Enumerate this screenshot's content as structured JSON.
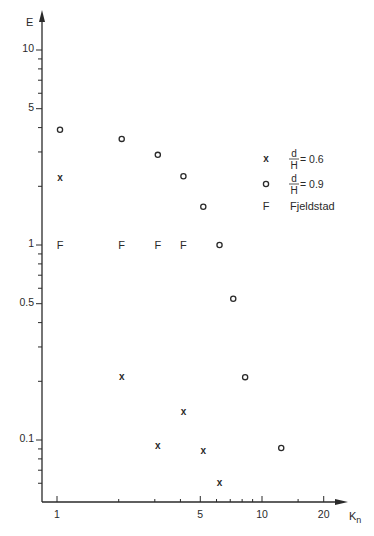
{
  "chart_data": {
    "type": "scatter",
    "title": "",
    "xlabel": "K_n",
    "ylabel": "E",
    "xscale": "log",
    "yscale": "log",
    "xlim": [
      0.85,
      30
    ],
    "ylim": [
      0.05,
      16
    ],
    "x_ticks_labeled": [
      1,
      5,
      10,
      20
    ],
    "x_tick_labels": [
      "1",
      "5",
      "10",
      "20"
    ],
    "x_ticks_minor": [
      2,
      3,
      4,
      6,
      7,
      8,
      9,
      15
    ],
    "y_ticks_labeled": [
      0.1,
      0.5,
      1,
      5,
      10
    ],
    "y_tick_labels": [
      "0.1",
      "0.5",
      "1",
      "5",
      "10"
    ],
    "y_ticks_minor": [
      0.06,
      0.07,
      0.08,
      0.09,
      0.2,
      0.3,
      0.4,
      0.6,
      0.7,
      0.8,
      0.9,
      2,
      3,
      4,
      6,
      7,
      8,
      9
    ],
    "grid": false,
    "legend_position": "right",
    "series": [
      {
        "name": "d/H = 0.6",
        "marker": "x",
        "x": [
          1,
          2,
          3,
          4,
          5,
          6
        ],
        "y": [
          2.2,
          0.21,
          0.093,
          0.14,
          0.088,
          0.06
        ]
      },
      {
        "name": "d/H = 0.9",
        "marker": "o",
        "x": [
          1,
          2,
          3,
          4,
          5,
          6,
          7,
          8,
          12
        ],
        "y": [
          3.9,
          3.5,
          2.9,
          2.25,
          1.57,
          1.0,
          0.53,
          0.21,
          0.091
        ]
      },
      {
        "name": "Fjeldstad",
        "marker": "F",
        "x": [
          1,
          2,
          3,
          4
        ],
        "y": [
          1.0,
          1.0,
          1.0,
          1.0
        ]
      }
    ],
    "legend": [
      {
        "marker": "x",
        "label_num": "d",
        "label_den": "H",
        "label_value": "= 0.6"
      },
      {
        "marker": "o",
        "label_num": "d",
        "label_den": "H",
        "label_value": "= 0.9"
      },
      {
        "marker": "F",
        "label": "Fjeldstad"
      }
    ]
  }
}
